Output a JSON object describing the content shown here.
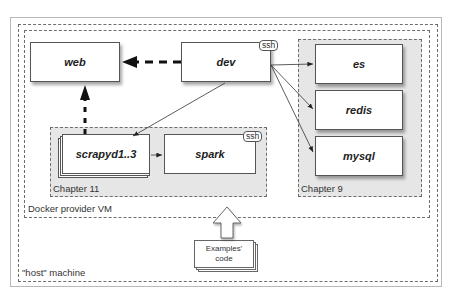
{
  "diagram": {
    "regions": {
      "host": {
        "label": "\"host\" machine"
      },
      "vm": {
        "label": "Docker provider VM"
      },
      "chapter9": {
        "label": "Chapter 9"
      },
      "chapter11": {
        "label": "Chapter 11"
      }
    },
    "nodes": {
      "web": {
        "label": "web"
      },
      "dev": {
        "label": "dev",
        "badge": "ssh"
      },
      "es": {
        "label": "es"
      },
      "redis": {
        "label": "redis"
      },
      "mysql": {
        "label": "mysql"
      },
      "scrapyd": {
        "label": "scrapyd1..3"
      },
      "spark": {
        "label": "spark",
        "badge": "ssh"
      }
    },
    "source": {
      "line1": "Examples'",
      "line2": "code"
    },
    "edges": [
      {
        "from": "dev",
        "to": "web",
        "style": "thick-dashed"
      },
      {
        "from": "scrapyd",
        "to": "web",
        "style": "thick-dashed"
      },
      {
        "from": "dev",
        "to": "scrapyd",
        "style": "thin"
      },
      {
        "from": "dev",
        "to": "es",
        "style": "thin"
      },
      {
        "from": "dev",
        "to": "redis",
        "style": "thin"
      },
      {
        "from": "dev",
        "to": "mysql",
        "style": "thin"
      },
      {
        "from": "scrapyd",
        "to": "spark",
        "style": "thin"
      },
      {
        "from": "source",
        "to": "vm",
        "style": "block-arrow"
      }
    ]
  }
}
